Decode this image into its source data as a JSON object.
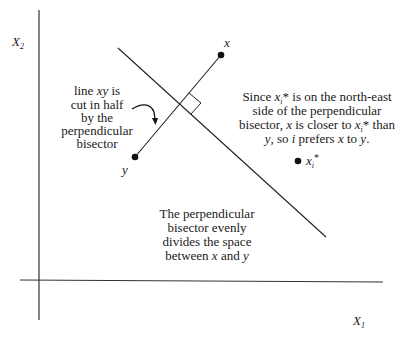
{
  "axes": {
    "x_label": "X",
    "x_label_sub": "1",
    "y_label": "X",
    "y_label_sub": "2"
  },
  "points": {
    "x": {
      "label": "x"
    },
    "y": {
      "label": "y"
    },
    "ideal": {
      "label": "x",
      "label_sub": "i",
      "label_sup": "*"
    }
  },
  "annotations": {
    "left": {
      "lines": [
        "line xy is",
        "cut in half",
        "by the",
        "perpendicular",
        "bisector"
      ],
      "line1_pre": "line ",
      "line1_ital": "xy",
      "line1_post": " is"
    },
    "right": {
      "l1_a": "Since ",
      "l1_x": "x",
      "l1_sub": "i",
      "l1_b": "* is on the north-east",
      "l2": "side of the perpendicular",
      "l3_a": "bisector, ",
      "l3_x": "x",
      "l3_b": " is closer to ",
      "l3_x2": "x",
      "l3_sub": "i",
      "l3_c": "* than",
      "l4_y": "y",
      "l4_a": ", so ",
      "l4_i": "i",
      "l4_b": " prefers ",
      "l4_x": "x",
      "l4_c": " to ",
      "l4_y2": "y",
      "l4_d": "."
    },
    "bottom": {
      "l1": "The perpendicular",
      "l2": "bisector evenly",
      "l3": "divides the space",
      "l4_a": "between ",
      "l4_x": "x",
      "l4_b": " and ",
      "l4_y": "y"
    }
  },
  "colors": {
    "ink": "#1a1a1a",
    "background": "#ffffff"
  }
}
